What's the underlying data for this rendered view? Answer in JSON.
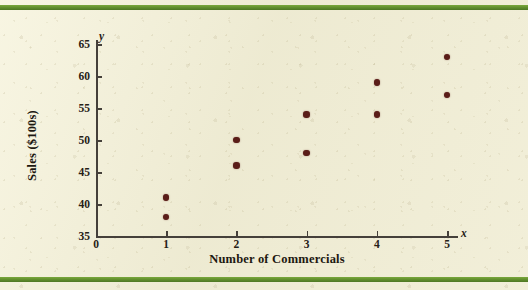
{
  "figure": {
    "background_color": "#efecd4",
    "rule_color": "#5f8c2c",
    "point_color": "#5a1d18",
    "axis_color": "#45403a"
  },
  "chart_data": {
    "type": "scatter",
    "title": "",
    "xlabel": "Number of Commercials",
    "ylabel": "Sales ($100s)",
    "x_var_symbol": "x",
    "y_var_symbol": "y",
    "xlim": [
      0,
      5.4
    ],
    "ylim": [
      35,
      66
    ],
    "xticks": [
      0,
      1,
      2,
      3,
      4,
      5
    ],
    "xtick_labels": [
      "0",
      "1",
      "2",
      "3",
      "4",
      "5"
    ],
    "yticks": [
      35,
      40,
      45,
      50,
      55,
      60,
      65
    ],
    "ytick_labels": [
      "35",
      "40",
      "45",
      "50",
      "55",
      "60",
      "65"
    ],
    "grid": false,
    "legend": null,
    "marker": "filled-circle",
    "points": [
      {
        "x": 1,
        "y": 41
      },
      {
        "x": 1,
        "y": 38
      },
      {
        "x": 2,
        "y": 50
      },
      {
        "x": 2,
        "y": 46
      },
      {
        "x": 3,
        "y": 54
      },
      {
        "x": 3,
        "y": 48
      },
      {
        "x": 4,
        "y": 59
      },
      {
        "x": 4,
        "y": 54
      },
      {
        "x": 5,
        "y": 63
      },
      {
        "x": 5,
        "y": 57
      }
    ]
  }
}
